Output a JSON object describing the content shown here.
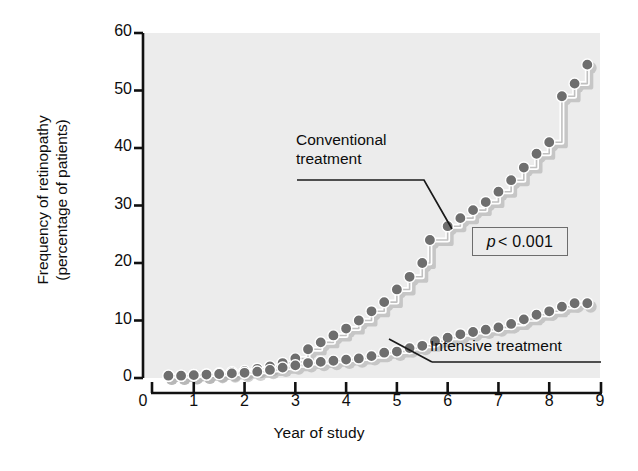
{
  "chart_data": {
    "type": "line",
    "title": "",
    "subtitle": "",
    "xlabel": "Year of study",
    "ylabel": "Frequency of retinopathy\n(percentage of patients)",
    "xlim": [
      0,
      9
    ],
    "ylim": [
      0,
      60
    ],
    "xticks": [
      0,
      1,
      2,
      3,
      4,
      5,
      6,
      7,
      8,
      9
    ],
    "yticks": [
      0,
      10,
      20,
      30,
      40,
      50,
      60
    ],
    "grid": false,
    "legend_position": "inline-annotations",
    "style": "step-kaplan-meier cumulative incidence with circular markers and drop shadow",
    "plot_background": "#ececec",
    "marker_color": "#6e6e6e",
    "line_color": "#ffffff",
    "axis_color": "#111111",
    "annotations": [
      {
        "text": "Conventional\ntreatment",
        "points_to_series": "Conventional treatment",
        "points_to_x": 5.65,
        "points_to_y": 24.0
      },
      {
        "text": "Intensive treatment",
        "points_to_series": "Intensive treatment",
        "points_to_x": 4.75,
        "points_to_y": 4.4
      },
      {
        "text": "p < 0.001",
        "kind": "statistic-box"
      }
    ],
    "series": [
      {
        "name": "Conventional treatment",
        "x": [
          0.5,
          0.75,
          1.0,
          1.25,
          1.5,
          1.75,
          2.0,
          2.25,
          2.5,
          2.75,
          3.0,
          3.25,
          3.5,
          3.75,
          4.0,
          4.25,
          4.5,
          4.75,
          5.0,
          5.25,
          5.5,
          5.65,
          6.0,
          6.25,
          6.5,
          6.75,
          7.0,
          7.25,
          7.5,
          7.75,
          8.0,
          8.25,
          8.5,
          8.75
        ],
        "y": [
          0.4,
          0.4,
          0.5,
          0.6,
          0.8,
          1.0,
          1.2,
          1.6,
          2.0,
          2.6,
          3.4,
          5.0,
          6.2,
          7.4,
          8.6,
          10.0,
          11.6,
          13.2,
          15.4,
          17.6,
          20.0,
          24.0,
          26.4,
          27.8,
          29.2,
          30.6,
          32.4,
          34.4,
          36.6,
          39.0,
          41.0,
          49.0,
          51.2,
          54.5
        ]
      },
      {
        "name": "Intensive treatment",
        "x": [
          0.5,
          0.75,
          1.0,
          1.25,
          1.5,
          1.75,
          2.0,
          2.25,
          2.5,
          2.75,
          3.0,
          3.25,
          3.5,
          3.75,
          4.0,
          4.25,
          4.5,
          4.75,
          5.0,
          5.25,
          5.5,
          5.75,
          6.0,
          6.25,
          6.5,
          6.75,
          7.0,
          7.25,
          7.5,
          7.75,
          8.0,
          8.25,
          8.5,
          8.75
        ],
        "y": [
          0.4,
          0.4,
          0.5,
          0.6,
          0.7,
          0.8,
          0.9,
          1.1,
          1.4,
          1.8,
          2.2,
          2.6,
          2.8,
          3.0,
          3.2,
          3.4,
          3.8,
          4.4,
          4.6,
          5.2,
          5.6,
          6.4,
          7.0,
          7.6,
          8.0,
          8.4,
          8.8,
          9.4,
          10.2,
          11.0,
          11.6,
          12.4,
          13.0,
          13.0
        ]
      }
    ]
  },
  "axes": {
    "ytick_labels": [
      "60",
      "50",
      "40",
      "30",
      "20",
      "10",
      "0"
    ],
    "xtick_labels": [
      "0",
      "1",
      "2",
      "3",
      "4",
      "5",
      "6",
      "7",
      "8",
      "9"
    ],
    "y_axis_title": "Frequency of retinopathy\n(percentage of patients)",
    "x_axis_title": "Year of study"
  },
  "labels": {
    "conventional": "Conventional\ntreatment",
    "intensive": "Intensive treatment",
    "pvalue_italic": "p",
    "pvalue_rest": "< 0.001"
  }
}
